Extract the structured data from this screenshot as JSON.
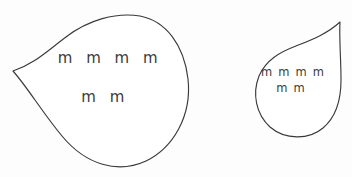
{
  "canvas": {
    "width": 352,
    "height": 177,
    "background_color": "#fdfdfd",
    "stroke_color": "#3a3a3a",
    "text_color": "#3b3b3b"
  },
  "shapes": [
    {
      "id": "left-teardrop",
      "name": "large-teardrop-shape",
      "cusp_direction": "left",
      "path": "M 13 71 C 34 64 46 52 66 37 C 88 20 116 12 140 16 C 166 21 184 45 188 79 C 192 116 173 148 146 161 C 118 174 86 165 62 136 C 42 112 28 88 13 71 Z",
      "labels": [
        {
          "id": "left-line-1",
          "text": "m m m m",
          "x": 110,
          "y": 58,
          "size": "large"
        },
        {
          "id": "left-line-2",
          "text": "m m",
          "x": 105,
          "y": 97,
          "size": "large"
        }
      ]
    },
    {
      "id": "right-teardrop",
      "name": "small-teardrop-shape",
      "cusp_direction": "up-right",
      "path": "M 340 22 C 327 34 311 40 296 46 C 280 52 266 60 259 76 C 252 94 256 114 270 127 C 285 140 309 140 323 128 C 336 117 341 99 341 80 C 341 58 339 38 340 22 Z",
      "labels": [
        {
          "id": "right-line-1",
          "text": "m m m m",
          "x": 293,
          "y": 72,
          "size": "small"
        },
        {
          "id": "right-line-2",
          "text": "m m",
          "x": 291,
          "y": 88,
          "size": "small"
        }
      ]
    }
  ]
}
